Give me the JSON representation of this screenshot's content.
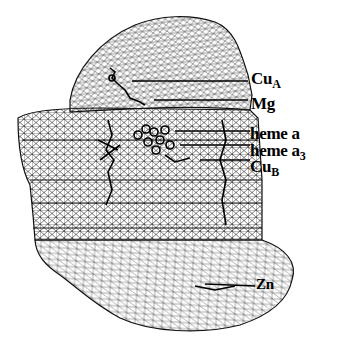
{
  "figure": {
    "colors": {
      "ink": "#000000",
      "background": "#ffffff",
      "mesh": "#1a1a1a"
    }
  },
  "labels": [
    {
      "id": "cua",
      "base": "Cu",
      "sub": "A"
    },
    {
      "id": "mg",
      "base": "Mg",
      "sub": ""
    },
    {
      "id": "heme-a",
      "base": "heme a",
      "sub": ""
    },
    {
      "id": "heme-a3",
      "base": "heme a",
      "sub": "3"
    },
    {
      "id": "cub",
      "base": "Cu",
      "sub": "B"
    },
    {
      "id": "zn",
      "base": "Zn",
      "sub": ""
    }
  ]
}
